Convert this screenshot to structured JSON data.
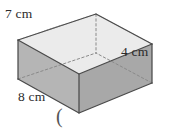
{
  "figure": {
    "kind": "rectangular-prism",
    "labels": {
      "depth": "7 cm",
      "height": "4 cm",
      "width": "8 cm"
    },
    "trailing_text": "(",
    "colors": {
      "top_face": "#ebebeb",
      "left_face": "#b5b5b5",
      "right_face": "#a8a8a8",
      "edge": "#4a4a4a",
      "hidden_edge": "#8a8a8a",
      "text": "#2b2b2b",
      "background": "#ffffff"
    },
    "geometry": {
      "top_back": [
        96,
        14
      ],
      "top_left": [
        18,
        40
      ],
      "top_front": [
        79,
        74
      ],
      "top_right": [
        152,
        44
      ],
      "bot_left": [
        18,
        79
      ],
      "bot_front": [
        79,
        113
      ],
      "bot_right": [
        152,
        83
      ],
      "bot_back": [
        96,
        53
      ]
    },
    "dimensions": {
      "width_cm": 8,
      "depth_cm": 7,
      "height_cm": 4,
      "unit": "cm"
    }
  }
}
